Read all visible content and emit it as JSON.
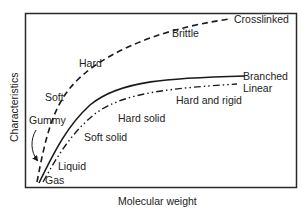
{
  "diagram": {
    "type": "polymer-characteristics-vs-molecular-weight",
    "axes": {
      "x_label": "Molecular weight",
      "y_label": "Characteristics"
    },
    "curves": [
      {
        "name": "Crosslinked",
        "style": "dashed"
      },
      {
        "name": "Branched",
        "style": "solid"
      },
      {
        "name": "Linear",
        "style": "dash-dot-dot"
      }
    ],
    "labels": {
      "brittle": "Brittle",
      "crosslinked": "Crosslinked",
      "hard": "Hard",
      "soft": "Soft",
      "gummy": "Gummy",
      "liquid": "Liquid",
      "gas": "Gas",
      "branched": "Branched",
      "linear": "Linear",
      "hard_and_rigid": "Hard and rigid",
      "hard_solid": "Hard solid",
      "soft_solid": "Soft solid"
    },
    "colors": {
      "line": "#1a1a1a",
      "frame": "#2a2a2a",
      "background": "#ffffff"
    }
  }
}
